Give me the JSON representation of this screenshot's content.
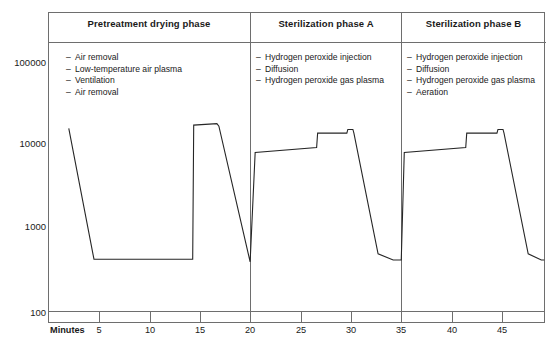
{
  "figure": {
    "x_axis_caption": "Minutes"
  },
  "phases": [
    {
      "title": "Pretreatment drying phase",
      "start_min": 0,
      "end_min": 20,
      "steps": [
        "Air removal",
        "Low-temperature air plasma",
        "Ventilation",
        "Air removal"
      ]
    },
    {
      "title": "Sterilization phase A",
      "start_min": 20,
      "end_min": 35,
      "steps": [
        "Hydrogen peroxide injection",
        "Diffusion",
        "Hydrogen peroxide gas plasma"
      ]
    },
    {
      "title": "Sterilization phase B",
      "start_min": 35,
      "end_min": 49.2,
      "steps": [
        "Hydrogen peroxide injection",
        "Diffusion",
        "Hydrogen peroxide gas plasma",
        "Aeration"
      ]
    }
  ],
  "bullet_dash": "–",
  "chart_data": {
    "type": "line",
    "title": "",
    "xlabel": "Minutes",
    "ylabel": "",
    "xlim": [
      0,
      49.2
    ],
    "ylim": [
      100,
      300000
    ],
    "yscale": "log",
    "grid": false,
    "legend": null,
    "xticks": [
      5,
      10,
      15,
      20,
      25,
      30,
      35,
      40,
      45
    ],
    "xtick_labels": [
      "5",
      "10",
      "15",
      "20",
      "25",
      "30",
      "35",
      "40",
      "45"
    ],
    "yticks": [
      100,
      1000,
      10000,
      100000
    ],
    "ytick_labels": [
      "100",
      "1000",
      "10000",
      "100000"
    ],
    "annotations": [
      {
        "x": 20,
        "label": "phase divider"
      },
      {
        "x": 35,
        "label": "phase divider"
      }
    ],
    "series": [
      {
        "name": "Chamber pressure",
        "points": [
          {
            "x": 2.0,
            "y": 16000
          },
          {
            "x": 4.5,
            "y": 430
          },
          {
            "x": 14.3,
            "y": 430
          },
          {
            "x": 14.4,
            "y": 17500
          },
          {
            "x": 16.7,
            "y": 18200
          },
          {
            "x": 16.9,
            "y": 17000
          },
          {
            "x": 20.0,
            "y": 400
          },
          {
            "x": 20.5,
            "y": 8200
          },
          {
            "x": 26.6,
            "y": 9400
          },
          {
            "x": 26.7,
            "y": 14000
          },
          {
            "x": 29.6,
            "y": 14000
          },
          {
            "x": 29.7,
            "y": 15500
          },
          {
            "x": 30.2,
            "y": 15500
          },
          {
            "x": 30.3,
            "y": 14000
          },
          {
            "x": 32.7,
            "y": 500
          },
          {
            "x": 34.2,
            "y": 420
          },
          {
            "x": 35.0,
            "y": 420
          },
          {
            "x": 35.3,
            "y": 8200
          },
          {
            "x": 41.4,
            "y": 9400
          },
          {
            "x": 41.5,
            "y": 14000
          },
          {
            "x": 44.5,
            "y": 14000
          },
          {
            "x": 44.6,
            "y": 15500
          },
          {
            "x": 45.1,
            "y": 15500
          },
          {
            "x": 45.2,
            "y": 14000
          },
          {
            "x": 47.6,
            "y": 500
          },
          {
            "x": 48.9,
            "y": 420
          },
          {
            "x": 49.2,
            "y": 420
          }
        ]
      }
    ]
  }
}
